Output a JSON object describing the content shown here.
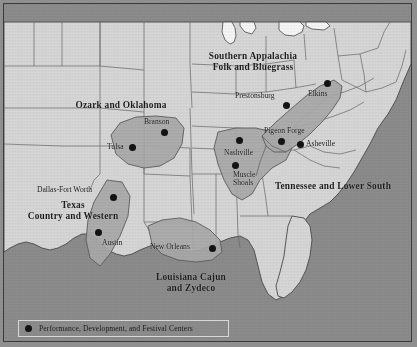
{
  "map": {
    "title": "American Music Regions",
    "colors": {
      "water": "#8c8c8c",
      "land": "#d7d7d7",
      "region_fill": "#a9a9a9",
      "lake": "#f2f2f2",
      "border": "#4a4a4a",
      "state_line": "#6e6e6e",
      "dot": "#131313",
      "text": "#1b1b1b",
      "frame": "#3a3a3a"
    },
    "regions": [
      {
        "id": "southern-appalachia",
        "label": "Southern Appalachia\nFolk and Bluegrass",
        "label_x": 188,
        "label_y": 47,
        "label_width": 122,
        "font_size": 9.4
      },
      {
        "id": "ozark-oklahoma",
        "label": "Ozark and Oklahoma",
        "label_x": 58,
        "label_y": 96,
        "label_width": 118,
        "font_size": 9.4
      },
      {
        "id": "tennessee-lower-south",
        "label": "Tennessee and Lower South",
        "label_x": 255,
        "label_y": 177,
        "label_width": 148,
        "font_size": 9.4
      },
      {
        "id": "texas-country-western",
        "label": "Texas\nCountry and Western",
        "label_x": 10,
        "label_y": 196,
        "label_width": 118,
        "font_size": 9.4
      },
      {
        "id": "louisiana-cajun-zydeco",
        "label": "Louisiana Cajun\nand Zydeco",
        "label_x": 131,
        "label_y": 268,
        "label_width": 112,
        "font_size": 9.4
      }
    ],
    "cities": [
      {
        "id": "branson",
        "name": "Branson",
        "dot_x": 160,
        "dot_y": 128,
        "label_x": 140,
        "label_y": 114,
        "font_size": 7.6
      },
      {
        "id": "tulsa",
        "name": "Tulsa",
        "dot_x": 128,
        "dot_y": 143,
        "label_x": 103,
        "label_y": 139,
        "font_size": 7.6
      },
      {
        "id": "prestonsburg",
        "name": "Prestonsburg",
        "dot_x": 282,
        "dot_y": 101,
        "label_x": 231,
        "label_y": 88,
        "font_size": 7.6
      },
      {
        "id": "elkins",
        "name": "Elkins",
        "dot_x": 323,
        "dot_y": 79,
        "label_x": 304,
        "label_y": 86,
        "font_size": 7.6
      },
      {
        "id": "pigeon-forge",
        "name": "Pigeon Forge",
        "dot_x": 277,
        "dot_y": 137,
        "label_x": 260,
        "label_y": 123,
        "font_size": 7.6
      },
      {
        "id": "asheville",
        "name": "Asheville",
        "dot_x": 296,
        "dot_y": 140,
        "label_x": 302,
        "label_y": 136,
        "font_size": 7.6
      },
      {
        "id": "nashville",
        "name": "Nashville",
        "dot_x": 235,
        "dot_y": 136,
        "label_x": 220,
        "label_y": 145,
        "font_size": 7.6
      },
      {
        "id": "muscle-shoals",
        "name": "Muscle\nShoals",
        "dot_x": 231,
        "dot_y": 161,
        "label_x": 229,
        "label_y": 167,
        "font_size": 7.6
      },
      {
        "id": "dallas-fort-worth",
        "name": "Dallas-Fort Worth",
        "dot_x": 109,
        "dot_y": 193,
        "label_x": 33,
        "label_y": 182,
        "font_size": 7.6
      },
      {
        "id": "austin",
        "name": "Austin",
        "dot_x": 94,
        "dot_y": 228,
        "label_x": 98,
        "label_y": 235,
        "font_size": 7.6
      },
      {
        "id": "new-orleans",
        "name": "New Orleans",
        "dot_x": 208,
        "dot_y": 244,
        "label_x": 146,
        "label_y": 239,
        "font_size": 7.6
      }
    ],
    "legend": {
      "marker": "filled-circle",
      "text": "Performance, Development, and Festival Centers"
    }
  }
}
